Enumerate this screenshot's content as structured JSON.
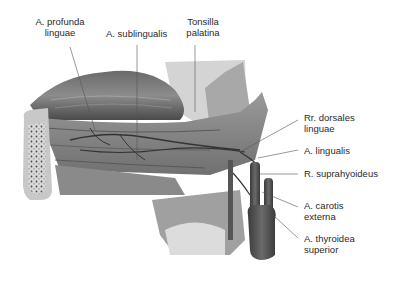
{
  "figure": {
    "labels_top": [
      {
        "id": "a-profunda-linguae",
        "line1": "A. profunda",
        "line2": "linguae"
      },
      {
        "id": "a-sublingualis",
        "line1": "A. sublingualis",
        "line2": ""
      },
      {
        "id": "tonsilla-palatina",
        "line1": "Tonsilla",
        "line2": "palatina"
      }
    ],
    "labels_right": [
      {
        "id": "rr-dorsales-linguae",
        "line1": "Rr. dorsales",
        "line2": "linguae"
      },
      {
        "id": "a-lingualis",
        "line1": "A. lingualis",
        "line2": ""
      },
      {
        "id": "r-suprahyoideus",
        "line1": "R. suprahyoideus",
        "line2": ""
      },
      {
        "id": "a-carotis-externa",
        "line1": "A. carotis",
        "line2": "externa"
      },
      {
        "id": "a-thyroidea-superior",
        "line1": "A. thyroidea",
        "line2": "superior"
      }
    ],
    "colors": {
      "tongue_dark": "#555555",
      "muscle_mid": "#8a8a8a",
      "bone": "#c8c8c8",
      "artery": "#3c3c3c",
      "leader_line": "#555555",
      "text": "#2a2a2a"
    }
  }
}
